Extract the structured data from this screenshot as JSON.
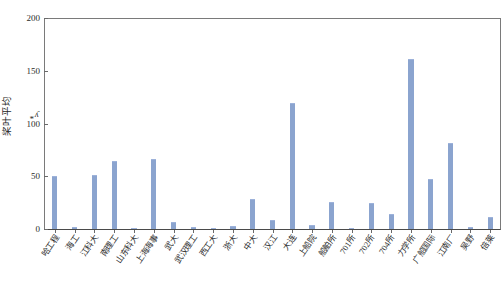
{
  "chart_data": {
    "type": "bar",
    "title": "",
    "subtitle": "",
    "xlabel": "",
    "ylabel": "桨叶平均 y*",
    "ylim": [
      0,
      200
    ],
    "yticks": [
      0,
      50,
      100,
      150,
      200
    ],
    "ytick_labels": [
      "0",
      "50",
      "100",
      "150",
      "200"
    ],
    "grid": false,
    "legend": null,
    "bar_color": "#8ba4cf",
    "axis_color": "#6a6a6a",
    "categories": [
      "哈工程",
      "海工",
      "江科大",
      "南理工",
      "山东科大",
      "上海海事",
      "武大",
      "武汉理工",
      "西工大",
      "浙大",
      "中大",
      "汉江",
      "大连",
      "上船院",
      "船舶所",
      "701所",
      "702所",
      "704所",
      "力学所",
      "广船国际",
      "江南厂",
      "吴野",
      "倍莱"
    ],
    "values": [
      50,
      2,
      51,
      64,
      0.5,
      66,
      7,
      2,
      0.5,
      3,
      28,
      9,
      119,
      4,
      26,
      0.4,
      25,
      14,
      161,
      47,
      82,
      2,
      11
    ]
  }
}
